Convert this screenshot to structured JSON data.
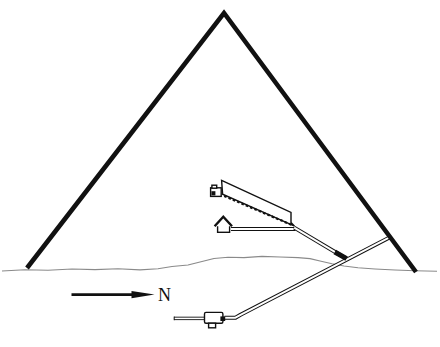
{
  "figure": {
    "type": "diagram",
    "background_color": "#ffffff",
    "ink_color": "#111111",
    "ground_color": "#8a8a8a",
    "compass": {
      "label": "N",
      "direction": "right"
    },
    "parts": [
      "pyramid-outline",
      "ground-line",
      "grand-gallery",
      "gallery-ramp",
      "kings-chamber",
      "sarcophagus",
      "queens-chamber",
      "horizontal-passage",
      "ascending-passage",
      "granite-plug",
      "descending-passage",
      "entrance",
      "subterranean-chamber",
      "pit",
      "blind-passage",
      "north-arrow"
    ]
  }
}
